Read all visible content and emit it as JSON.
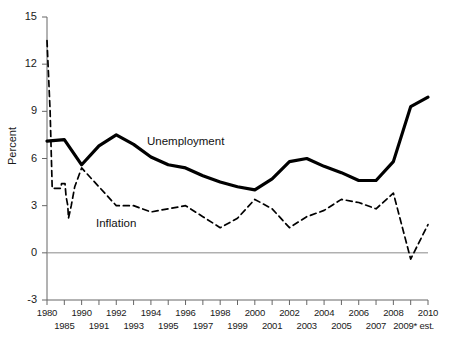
{
  "chart_data": {
    "type": "line",
    "title": "",
    "subtitle": "",
    "xlabel": "",
    "ylabel": "Percent",
    "ylim": [
      -3,
      15
    ],
    "yticks": [
      15,
      12,
      9,
      6,
      3,
      0,
      -3
    ],
    "ytick_labels": [
      "15",
      "12",
      "9",
      "6",
      "3",
      "0",
      "-3"
    ],
    "grid": false,
    "zero_line": true,
    "legend_position": "inline-annotation",
    "axis_note": "x axis is non-uniform: 1980 and 1985 are single ticks, then every year 1990-2010",
    "categories": [
      "1980",
      "1985",
      "1990",
      "1991",
      "1992",
      "1993",
      "1994",
      "1995",
      "1996",
      "1997",
      "1998",
      "1999",
      "2000",
      "2001",
      "2002",
      "2003",
      "2004",
      "2005",
      "2006",
      "2007",
      "2008",
      "2009",
      "2010"
    ],
    "xtick_labels_top": [
      "1980",
      "",
      "1990",
      "",
      "1992",
      "",
      "1994",
      "",
      "1996",
      "",
      "1998",
      "",
      "2000",
      "",
      "2002",
      "",
      "2004",
      "",
      "2006",
      "",
      "2008",
      "",
      "2010"
    ],
    "xtick_labels_bottom": [
      "",
      "1985",
      "",
      "1991",
      "",
      "1993",
      "",
      "1995",
      "",
      "1997",
      "",
      "1999",
      "",
      "2001",
      "",
      "2003",
      "",
      "2005",
      "",
      "2007",
      "",
      "2009* est.",
      ""
    ],
    "xtick_labels_flat": [
      "1980",
      "1985",
      "1990",
      "1991",
      "1992",
      "1993",
      "1994",
      "1995",
      "1996",
      "1997",
      "1998",
      "1999",
      "2000",
      "2001",
      "2002",
      "2003",
      "2004",
      "2005",
      "2006",
      "2007",
      "2008",
      "2009* est.",
      "2010"
    ],
    "series": [
      {
        "name": "Unemployment",
        "style": "solid-thick",
        "color": "#000000",
        "label_x_category": "1995",
        "values": [
          7.1,
          7.2,
          5.6,
          6.8,
          7.5,
          6.9,
          6.1,
          5.6,
          5.4,
          4.9,
          4.5,
          4.2,
          4.0,
          4.7,
          5.8,
          6.0,
          5.5,
          5.1,
          4.6,
          4.6,
          5.8,
          9.3,
          9.9
        ]
      },
      {
        "name": "Inflation",
        "style": "dashed",
        "color": "#000000",
        "label_x_category": "1992",
        "values": [
          13.5,
          3.6,
          5.4,
          4.2,
          3.0,
          3.0,
          2.6,
          2.8,
          3.0,
          2.3,
          1.6,
          2.2,
          3.4,
          2.8,
          1.6,
          2.3,
          2.7,
          3.4,
          3.2,
          2.8,
          3.8,
          -0.4,
          1.8
        ]
      }
    ],
    "inflation_interstitial": {
      "note": "extra wiggle between 1980 and 1990 ticks (1981-1989 compressed)",
      "points": [
        [
          0.3,
          4.1
        ],
        [
          0.4,
          4.1
        ],
        [
          0.42,
          4.4
        ],
        [
          0.52,
          4.4
        ],
        [
          0.55,
          3.6
        ],
        [
          0.6,
          3.0
        ],
        [
          0.62,
          2.2
        ],
        [
          0.7,
          3.0
        ],
        [
          0.8,
          4.2
        ]
      ]
    },
    "colors": {
      "axis": "#666666",
      "zero_line": "#8a8a8a",
      "unemployment": "#000000",
      "inflation": "#000000",
      "background": "#ffffff"
    }
  }
}
